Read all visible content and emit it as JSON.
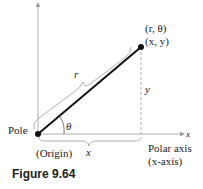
{
  "diagram": {
    "type": "polar-rectangular-relationship",
    "point_label_polar": "(r, θ)",
    "point_label_rect": "(x, y)",
    "segment_label": "r",
    "vertical_label": "y",
    "horizontal_label": "x",
    "angle_label": "θ",
    "pole_label": "Pole",
    "origin_label": "(Origin)",
    "axis_end_label": "x",
    "polar_axis_label": "Polar axis",
    "polar_axis_sub": "(x-axis)",
    "colors": {
      "segment": "#111111",
      "axes": "#9a9a9a",
      "dashed": "#9a9a9a",
      "bracket": "#9a9a9a"
    }
  },
  "caption": "Figure 9.64"
}
